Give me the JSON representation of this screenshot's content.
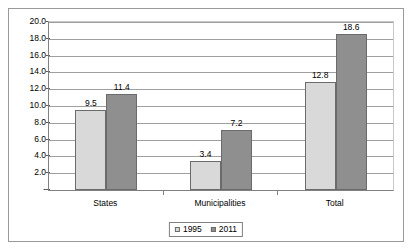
{
  "chart_data": {
    "type": "bar",
    "title": "",
    "subtitle": "",
    "xlabel": "",
    "ylabel": "",
    "categories": [
      "States",
      "Municipalities",
      "Total"
    ],
    "series": [
      {
        "name": "1995",
        "values": [
          9.5,
          3.4,
          12.8
        ],
        "color": "#d9d9d9"
      },
      {
        "name": "2011",
        "values": [
          11.4,
          7.2,
          18.6
        ],
        "color": "#8f8f8f"
      }
    ],
    "data_labels": [
      {
        "category": "States",
        "series": "1995",
        "text": "9.5"
      },
      {
        "category": "States",
        "series": "2011",
        "text": "11.4"
      },
      {
        "category": "Municipalities",
        "series": "1995",
        "text": "3.4"
      },
      {
        "category": "Municipalities",
        "series": "2011",
        "text": "7.2"
      },
      {
        "category": "Total",
        "series": "1995",
        "text": "12.8"
      },
      {
        "category": "Total",
        "series": "2011",
        "text": "18.6"
      }
    ],
    "ylim": [
      0,
      20
    ],
    "ytick_values": [
      20.0,
      18.0,
      16.0,
      14.0,
      12.0,
      10.0,
      8.0,
      6.0,
      4.0,
      2.0,
      0
    ],
    "ytick_labels": [
      "20.0",
      "18.0",
      "16.0",
      "14.0",
      "12.0",
      "10.0",
      "8.0",
      "6.0",
      "4.0",
      "2.0",
      "-"
    ],
    "grid": true,
    "legend_position": "bottom",
    "legend_entries": [
      "1995",
      "2011"
    ]
  }
}
